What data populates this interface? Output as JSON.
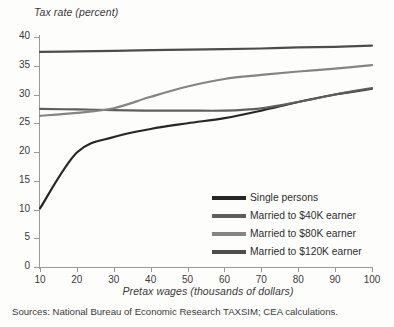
{
  "chart_data": {
    "type": "line",
    "title": "",
    "ylabel": "Tax rate (percent)",
    "xlabel": "Pretax wages (thousands of dollars)",
    "source": "Sources: National Bureau of Economic Research TAXSIM; CEA calculations.",
    "xlim": [
      10,
      100
    ],
    "ylim": [
      0,
      40
    ],
    "xticks": [
      10,
      20,
      30,
      40,
      50,
      60,
      70,
      80,
      90,
      100
    ],
    "yticks": [
      0,
      5,
      10,
      15,
      20,
      25,
      30,
      35,
      40
    ],
    "grid": false,
    "legend_position": "inside-lower-right",
    "x": [
      10,
      20,
      30,
      40,
      50,
      60,
      70,
      80,
      90,
      100
    ],
    "series": [
      {
        "name": "Single persons",
        "color": "#262626",
        "values": [
          10.2,
          19.9,
          22.6,
          24.0,
          25.0,
          25.9,
          27.2,
          28.7,
          30.0,
          31.0
        ]
      },
      {
        "name": "Married to $40K earner",
        "color": "#5e5e5e",
        "values": [
          27.5,
          27.4,
          27.3,
          27.2,
          27.2,
          27.2,
          27.6,
          28.7,
          30.0,
          31.1
        ]
      },
      {
        "name": "Married to $80K earner",
        "color": "#848484",
        "values": [
          26.3,
          26.8,
          27.6,
          29.6,
          31.4,
          32.7,
          33.4,
          34.0,
          34.5,
          35.1
        ]
      },
      {
        "name": "Married to $120K earner",
        "color": "#4d4d4d",
        "values": [
          37.4,
          37.5,
          37.6,
          37.7,
          37.8,
          37.9,
          38.0,
          38.2,
          38.3,
          38.5
        ]
      }
    ]
  }
}
